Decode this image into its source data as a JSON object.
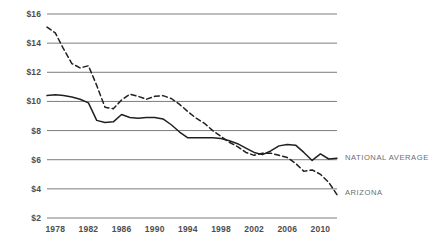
{
  "chart_data": {
    "type": "line",
    "title": "",
    "xlabel": "",
    "ylabel": "",
    "xlim": [
      1977,
      2012
    ],
    "ylim": [
      2,
      16
    ],
    "grid": true,
    "grid_axis": "y",
    "legend_position": "right-inline",
    "ytick_labels": [
      "$16",
      "$14",
      "$12",
      "$10",
      "$8",
      "$6",
      "$4",
      "$2"
    ],
    "ytick_values": [
      16,
      14,
      12,
      10,
      8,
      6,
      4,
      2
    ],
    "xtick_labels": [
      "1978",
      "1982",
      "1986",
      "1990",
      "1994",
      "1998",
      "2002",
      "2006",
      "2010"
    ],
    "xtick_values": [
      1978,
      1982,
      1986,
      1990,
      1994,
      1998,
      2002,
      2006,
      2010
    ],
    "x": [
      1977,
      1978,
      1979,
      1980,
      1981,
      1982,
      1983,
      1984,
      1985,
      1986,
      1987,
      1988,
      1989,
      1990,
      1991,
      1992,
      1993,
      1994,
      1995,
      1996,
      1997,
      1998,
      1999,
      2000,
      2001,
      2002,
      2003,
      2004,
      2005,
      2006,
      2007,
      2008,
      2009,
      2010,
      2011,
      2012
    ],
    "series": [
      {
        "name": "NATIONAL AVERAGE",
        "style": "solid",
        "color": "#231f20",
        "label_x": 2012.6,
        "label_y": 6.15,
        "values": [
          10.4,
          10.45,
          10.4,
          10.3,
          10.15,
          9.9,
          8.7,
          8.55,
          8.6,
          9.1,
          8.9,
          8.85,
          8.9,
          8.9,
          8.8,
          8.4,
          7.9,
          7.5,
          7.5,
          7.5,
          7.5,
          7.45,
          7.3,
          7.1,
          6.8,
          6.5,
          6.35,
          6.6,
          6.95,
          7.05,
          7.0,
          6.5,
          5.95,
          6.4,
          6.05,
          6.1
        ]
      },
      {
        "name": "ARIZONA",
        "style": "dashed",
        "color": "#231f20",
        "label_x": 2012.6,
        "label_y": 3.75,
        "values": [
          15.1,
          14.7,
          13.6,
          12.6,
          12.3,
          12.45,
          11.1,
          9.6,
          9.5,
          10.1,
          10.5,
          10.35,
          10.15,
          10.35,
          10.4,
          10.2,
          9.8,
          9.3,
          8.85,
          8.5,
          8.0,
          7.6,
          7.2,
          6.9,
          6.5,
          6.3,
          6.45,
          6.45,
          6.3,
          6.15,
          5.75,
          5.2,
          5.3,
          5.0,
          4.45,
          3.6
        ]
      }
    ]
  },
  "caption": {
    "text": ""
  }
}
